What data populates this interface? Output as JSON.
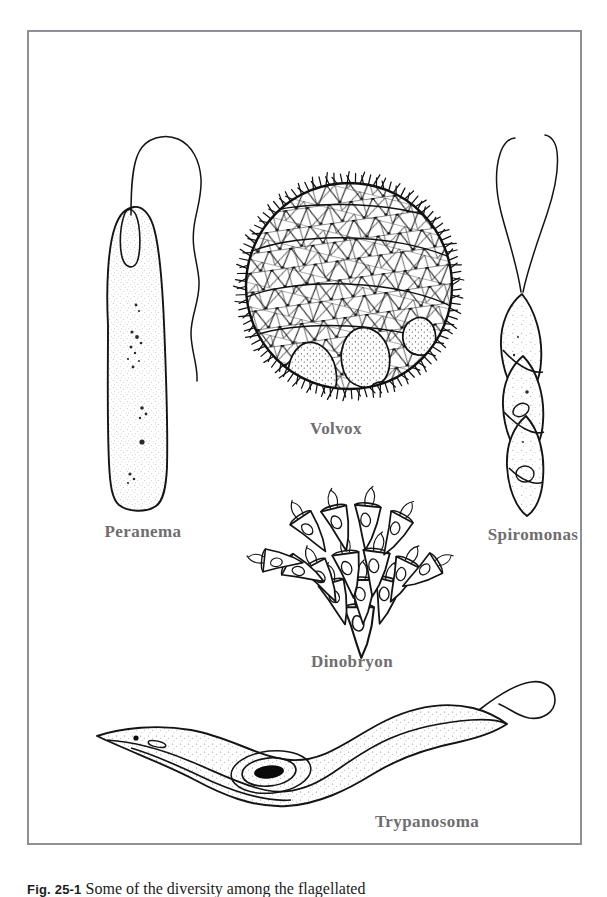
{
  "figure": {
    "type": "scientific-illustration-plate",
    "frame_color": "#8e9094",
    "background": "#ffffff",
    "ink_color": "#1a1a1a",
    "label_color": "#6e6e70"
  },
  "labels": {
    "peranema": "Peranema",
    "volvox": "Volvox",
    "spiromonas": "Spiromonas",
    "dinobryon": "Dinobryon",
    "trypanosoma": "Trypanosoma"
  },
  "caption": {
    "figure_number": "Fig. 25-1",
    "text": "Some of the diversity among the flagellated"
  },
  "organisms": [
    {
      "name": "Peranema",
      "label": "Peranema",
      "position": "upper-left",
      "description": "Elongated tapering unicell with granular cytoplasm and one long anterior flagellum that loops back",
      "flagella_count": 1
    },
    {
      "name": "Volvox",
      "label": "Volvox",
      "position": "upper-center",
      "description": "Spherical colony of cells joined by cytoplasmic strands, flagella projecting around the margin, several daughter colonies inside",
      "flagella_count": "many"
    },
    {
      "name": "Spiromonas",
      "label": "Spiromonas",
      "position": "upper-right",
      "description": "Spirally twisted elongated cell with two long anterior flagella",
      "flagella_count": 2
    },
    {
      "name": "Dinobryon",
      "label": "Dinobryon",
      "position": "center",
      "description": "Branching dendroid colony of vase-shaped loricas, each with a cell and flagella",
      "flagella_count": "many"
    },
    {
      "name": "Trypanosoma",
      "label": "Trypanosoma",
      "position": "bottom",
      "description": "S-shaped elongate blood parasite with undulating membrane, dark kinetoplast and nucleus, and free anterior flagellum",
      "flagella_count": 1
    }
  ]
}
